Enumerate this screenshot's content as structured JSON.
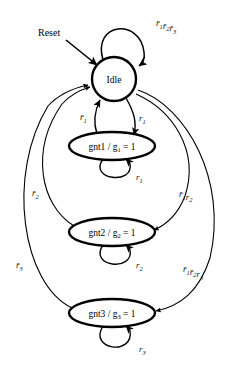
{
  "diagram": {
    "type": "finite-state-machine",
    "stroke_color": "#000000",
    "edge_color": "#222222",
    "background": "#ffffff"
  },
  "states": [
    {
      "id": "idle",
      "label": "Idle",
      "shape": "circle",
      "cx": 114,
      "cy": 79,
      "rx": 26,
      "ry": 21
    },
    {
      "id": "gnt1",
      "label": "gnt1 / g",
      "sub": "1",
      "eq": " = 1",
      "shape": "ellipse",
      "cx": 112,
      "cy": 146,
      "rx": 43,
      "ry": 14
    },
    {
      "id": "gnt2",
      "label": "gnt2 / g",
      "sub": "2",
      "eq": " = 1",
      "shape": "ellipse",
      "cx": 112,
      "cy": 232,
      "rx": 43,
      "ry": 14
    },
    {
      "id": "gnt3",
      "label": "gnt3 / g",
      "sub": "3",
      "eq": " = 1",
      "shape": "ellipse",
      "cx": 112,
      "cy": 313,
      "rx": 43,
      "ry": 14
    }
  ],
  "labels": {
    "reset": "Reset",
    "idle_self_loop": {
      "terms": [
        {
          "v": "r",
          "bar": true,
          "sub": "1"
        },
        {
          "v": "r",
          "bar": true,
          "sub": "2"
        },
        {
          "v": "r",
          "bar": true,
          "sub": "3"
        }
      ]
    },
    "idle_to_gnt1": {
      "terms": [
        {
          "v": "r",
          "bar": false,
          "sub": "1"
        }
      ]
    },
    "gnt1_to_idle": {
      "terms": [
        {
          "v": "r",
          "bar": true,
          "sub": "1"
        }
      ]
    },
    "gnt1_self_loop": {
      "terms": [
        {
          "v": "r",
          "bar": false,
          "sub": "1"
        }
      ]
    },
    "gnt2_to_idle": {
      "terms": [
        {
          "v": "r",
          "bar": true,
          "sub": "2"
        }
      ]
    },
    "gnt2_self_loop": {
      "terms": [
        {
          "v": "r",
          "bar": false,
          "sub": "2"
        }
      ]
    },
    "gnt3_to_idle": {
      "terms": [
        {
          "v": "r",
          "bar": true,
          "sub": "3"
        }
      ]
    },
    "gnt3_self_loop": {
      "terms": [
        {
          "v": "r",
          "bar": false,
          "sub": "3"
        }
      ]
    },
    "idle_to_gnt2": {
      "terms": [
        {
          "v": "r",
          "bar": true,
          "sub": "1"
        },
        {
          "v": "r",
          "bar": false,
          "sub": "2"
        }
      ]
    },
    "idle_to_gnt3": {
      "terms": [
        {
          "v": "r",
          "bar": true,
          "sub": "1"
        },
        {
          "v": "r",
          "bar": true,
          "sub": "2"
        },
        {
          "v": "r",
          "bar": false,
          "sub": "3"
        }
      ]
    }
  },
  "transitions": [
    {
      "id": "reset-entry",
      "from": "reset",
      "to": "idle",
      "label_key": "reset"
    },
    {
      "id": "idle-self",
      "from": "idle",
      "to": "idle",
      "label_key": "idle_self_loop"
    },
    {
      "id": "idle-gnt1",
      "from": "idle",
      "to": "gnt1",
      "label_key": "idle_to_gnt1"
    },
    {
      "id": "gnt1-idle",
      "from": "gnt1",
      "to": "idle",
      "label_key": "gnt1_to_idle"
    },
    {
      "id": "gnt1-self",
      "from": "gnt1",
      "to": "gnt1",
      "label_key": "gnt1_self_loop"
    },
    {
      "id": "idle-gnt2",
      "from": "idle",
      "to": "gnt2",
      "label_key": "idle_to_gnt2"
    },
    {
      "id": "gnt2-idle",
      "from": "gnt2",
      "to": "idle",
      "label_key": "gnt2_to_idle"
    },
    {
      "id": "gnt2-self",
      "from": "gnt2",
      "to": "gnt2",
      "label_key": "gnt2_self_loop"
    },
    {
      "id": "idle-gnt3",
      "from": "idle",
      "to": "gnt3",
      "label_key": "idle_to_gnt3"
    },
    {
      "id": "gnt3-idle",
      "from": "gnt3",
      "to": "idle",
      "label_key": "gnt3_to_idle"
    },
    {
      "id": "gnt3-self",
      "from": "gnt3",
      "to": "gnt3",
      "label_key": "gnt3_self_loop"
    }
  ]
}
